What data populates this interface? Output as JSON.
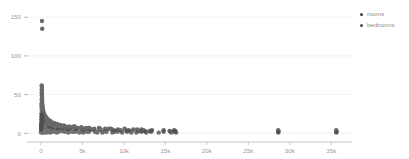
{
  "chart_data": {
    "type": "scatter",
    "title": "",
    "xlabel": "",
    "ylabel": "",
    "xlim": [
      -1200,
      37500
    ],
    "ylim": [
      -6,
      158
    ],
    "grid": true,
    "grid_axis": "y",
    "legend_position": "right",
    "xticks": [
      0,
      5000,
      10000,
      15000,
      20000,
      25000,
      30000,
      35000
    ],
    "xticklabels": [
      "0",
      "5k",
      "10k",
      "15k",
      "20k",
      "25k",
      "30k",
      "35k"
    ],
    "yticks": [
      0,
      50,
      100,
      150
    ],
    "yticklabels": [
      "0",
      "50",
      "100",
      "150"
    ],
    "series": [
      {
        "name": "rooms",
        "color": "#3f3f3f",
        "marker": "circle",
        "marker_size": 2.2,
        "points": [
          [
            120,
            145
          ],
          [
            150,
            135
          ],
          [
            90,
            62
          ],
          [
            110,
            60
          ],
          [
            95,
            57
          ],
          [
            130,
            55
          ],
          [
            100,
            53
          ],
          [
            120,
            51
          ],
          [
            105,
            49
          ],
          [
            140,
            47
          ],
          [
            115,
            45
          ],
          [
            95,
            43
          ],
          [
            160,
            42
          ],
          [
            130,
            40
          ],
          [
            110,
            38
          ],
          [
            175,
            37
          ],
          [
            145,
            36
          ],
          [
            120,
            35
          ],
          [
            200,
            34
          ],
          [
            165,
            33
          ],
          [
            135,
            32
          ],
          [
            230,
            31
          ],
          [
            185,
            30
          ],
          [
            150,
            29
          ],
          [
            270,
            29
          ],
          [
            210,
            28
          ],
          [
            170,
            27
          ],
          [
            320,
            27
          ],
          [
            245,
            26
          ],
          [
            195,
            25
          ],
          [
            380,
            25
          ],
          [
            290,
            24
          ],
          [
            225,
            24
          ],
          [
            450,
            23
          ],
          [
            345,
            23
          ],
          [
            265,
            22
          ],
          [
            540,
            22
          ],
          [
            410,
            21
          ],
          [
            315,
            21
          ],
          [
            650,
            20
          ],
          [
            490,
            20
          ],
          [
            375,
            19
          ],
          [
            780,
            19
          ],
          [
            590,
            18
          ],
          [
            450,
            18
          ],
          [
            930,
            17
          ],
          [
            710,
            17
          ],
          [
            540,
            16
          ],
          [
            1120,
            16
          ],
          [
            860,
            15
          ],
          [
            650,
            15
          ],
          [
            1350,
            14
          ],
          [
            1040,
            14
          ],
          [
            790,
            13
          ],
          [
            1620,
            13
          ],
          [
            1250,
            13
          ],
          [
            950,
            12
          ],
          [
            1950,
            12
          ],
          [
            1500,
            12
          ],
          [
            1150,
            11
          ],
          [
            2350,
            11
          ],
          [
            1800,
            11
          ],
          [
            1380,
            10
          ],
          [
            2820,
            10
          ],
          [
            2160,
            10
          ],
          [
            1660,
            10
          ],
          [
            3380,
            9
          ],
          [
            2590,
            9
          ],
          [
            1990,
            9
          ],
          [
            4060,
            9
          ],
          [
            3110,
            8
          ],
          [
            2390,
            8
          ],
          [
            4870,
            8
          ],
          [
            3730,
            8
          ],
          [
            2870,
            8
          ],
          [
            5840,
            7
          ],
          [
            4480,
            7
          ],
          [
            3440,
            7
          ],
          [
            7010,
            7
          ],
          [
            5380,
            7
          ],
          [
            4130,
            6
          ],
          [
            8410,
            6
          ],
          [
            6450,
            6
          ],
          [
            4960,
            6
          ],
          [
            10090,
            6
          ],
          [
            7740,
            6
          ],
          [
            5950,
            5
          ],
          [
            12110,
            5
          ],
          [
            9290,
            5
          ],
          [
            7140,
            5
          ],
          [
            11150,
            5
          ],
          [
            8570,
            5
          ],
          [
            13380,
            4
          ],
          [
            10280,
            4
          ],
          [
            12340,
            4
          ],
          [
            14800,
            4
          ],
          [
            16060,
            4
          ],
          [
            15500,
            3
          ],
          [
            16200,
            3
          ],
          [
            12500,
            3
          ],
          [
            13100,
            3
          ],
          [
            11800,
            3
          ],
          [
            28600,
            4
          ],
          [
            28650,
            2
          ],
          [
            35600,
            4
          ],
          [
            35650,
            2
          ],
          [
            250,
            21
          ],
          [
            300,
            19
          ],
          [
            420,
            18
          ],
          [
            610,
            16
          ],
          [
            880,
            14
          ],
          [
            1290,
            13
          ],
          [
            1880,
            11
          ],
          [
            2720,
            10
          ],
          [
            3960,
            9
          ],
          [
            5720,
            7
          ],
          [
            8200,
            6
          ],
          [
            11600,
            5
          ],
          [
            60,
            18
          ],
          [
            70,
            22
          ],
          [
            80,
            26
          ],
          [
            85,
            30
          ],
          [
            75,
            34
          ],
          [
            65,
            38
          ],
          [
            55,
            14
          ],
          [
            50,
            12
          ],
          [
            45,
            10
          ],
          [
            40,
            8
          ],
          [
            35,
            6
          ],
          [
            30,
            5
          ],
          [
            1000,
            9
          ],
          [
            1400,
            8
          ],
          [
            2000,
            7
          ],
          [
            2600,
            7
          ],
          [
            3200,
            6
          ],
          [
            4200,
            6
          ],
          [
            5200,
            5
          ],
          [
            6200,
            5
          ],
          [
            7200,
            5
          ],
          [
            8800,
            4
          ],
          [
            9600,
            4
          ],
          [
            10600,
            4
          ]
        ]
      },
      {
        "name": "bedrooms",
        "color": "#4a4a4a",
        "marker": "circle",
        "marker_size": 2.2,
        "points": [
          [
            100,
            24
          ],
          [
            115,
            22
          ],
          [
            125,
            20
          ],
          [
            95,
            19
          ],
          [
            140,
            18
          ],
          [
            110,
            17
          ],
          [
            155,
            16
          ],
          [
            130,
            15
          ],
          [
            175,
            15
          ],
          [
            150,
            14
          ],
          [
            200,
            13
          ],
          [
            170,
            13
          ],
          [
            230,
            12
          ],
          [
            195,
            12
          ],
          [
            265,
            11
          ],
          [
            220,
            11
          ],
          [
            305,
            10
          ],
          [
            255,
            10
          ],
          [
            355,
            10
          ],
          [
            295,
            9
          ],
          [
            410,
            9
          ],
          [
            340,
            9
          ],
          [
            480,
            8
          ],
          [
            395,
            8
          ],
          [
            560,
            8
          ],
          [
            460,
            7
          ],
          [
            650,
            7
          ],
          [
            535,
            7
          ],
          [
            760,
            7
          ],
          [
            625,
            6
          ],
          [
            890,
            6
          ],
          [
            730,
            6
          ],
          [
            1040,
            6
          ],
          [
            855,
            5
          ],
          [
            1210,
            5
          ],
          [
            995,
            5
          ],
          [
            1420,
            5
          ],
          [
            1165,
            5
          ],
          [
            1660,
            4
          ],
          [
            1360,
            4
          ],
          [
            1940,
            4
          ],
          [
            1590,
            4
          ],
          [
            2270,
            4
          ],
          [
            1860,
            4
          ],
          [
            2650,
            3
          ],
          [
            2170,
            3
          ],
          [
            3100,
            3
          ],
          [
            2540,
            3
          ],
          [
            3620,
            3
          ],
          [
            2970,
            3
          ],
          [
            4240,
            3
          ],
          [
            3470,
            3
          ],
          [
            4950,
            2
          ],
          [
            4060,
            2
          ],
          [
            5790,
            2
          ],
          [
            4750,
            2
          ],
          [
            6770,
            2
          ],
          [
            5550,
            2
          ],
          [
            7910,
            2
          ],
          [
            6490,
            2
          ],
          [
            9250,
            2
          ],
          [
            7590,
            2
          ],
          [
            10810,
            2
          ],
          [
            8870,
            2
          ],
          [
            12640,
            2
          ],
          [
            10370,
            2
          ],
          [
            14780,
            2
          ],
          [
            12120,
            2
          ],
          [
            15900,
            2
          ],
          [
            16150,
            2
          ],
          [
            13300,
            2
          ],
          [
            60,
            11
          ],
          [
            70,
            13
          ],
          [
            80,
            9
          ],
          [
            50,
            8
          ],
          [
            45,
            7
          ],
          [
            40,
            6
          ],
          [
            35,
            5
          ],
          [
            30,
            4
          ],
          [
            28,
            3
          ],
          [
            25,
            2
          ],
          [
            22,
            2
          ],
          [
            20,
            1
          ],
          [
            90,
            6
          ],
          [
            105,
            5
          ],
          [
            1500,
            2
          ],
          [
            2100,
            2
          ],
          [
            2900,
            2
          ],
          [
            3800,
            2
          ],
          [
            5100,
            1
          ],
          [
            6800,
            1
          ],
          [
            8600,
            1
          ],
          [
            10900,
            1
          ],
          [
            12700,
            1
          ],
          [
            14200,
            1
          ],
          [
            200,
            1
          ],
          [
            400,
            1
          ],
          [
            700,
            1
          ],
          [
            1100,
            1
          ],
          [
            1900,
            1
          ],
          [
            3300,
            1
          ],
          [
            4600,
            1
          ],
          [
            7400,
            1
          ],
          [
            9800,
            1
          ],
          [
            11500,
            1
          ],
          [
            15700,
            1
          ],
          [
            16300,
            1
          ],
          [
            28600,
            1
          ],
          [
            35600,
            1
          ]
        ]
      }
    ]
  },
  "legend": {
    "items": [
      {
        "label": "rooms",
        "color": "#3f3f3f"
      },
      {
        "label": "bedrooms",
        "color": "#4a4a4a"
      }
    ]
  },
  "axes": {
    "axis_color": "#b5b5b5",
    "grid_color": "#ededed",
    "tick_text_color": "#9a9a9a"
  }
}
